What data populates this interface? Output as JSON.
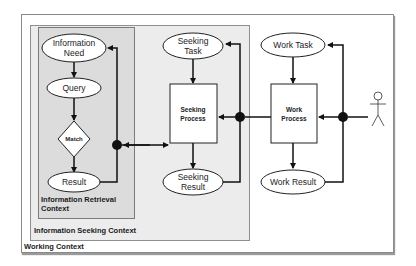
{
  "contexts": {
    "working": "Working Context",
    "seeking": "Information Seeking Context",
    "retrieval": "Information Retrieval\nContext"
  },
  "nodes": {
    "information_need": [
      "Information",
      "Need"
    ],
    "query": "Query",
    "match": "Match",
    "result": "Result",
    "seeking_task": [
      "Seeking",
      "Task"
    ],
    "seeking_process": [
      "Seeking",
      "Process"
    ],
    "seeking_result": [
      "Seeking",
      "Result"
    ],
    "work_task": "Work Task",
    "work_process": [
      "Work",
      "Process"
    ],
    "work_result": "Work Result"
  },
  "actor": "person-icon",
  "colors": {
    "line": "#111111",
    "node_fill": "#ffffff",
    "retrieval_bg": "#dcdcdc",
    "seeking_bg": "#ececec"
  }
}
